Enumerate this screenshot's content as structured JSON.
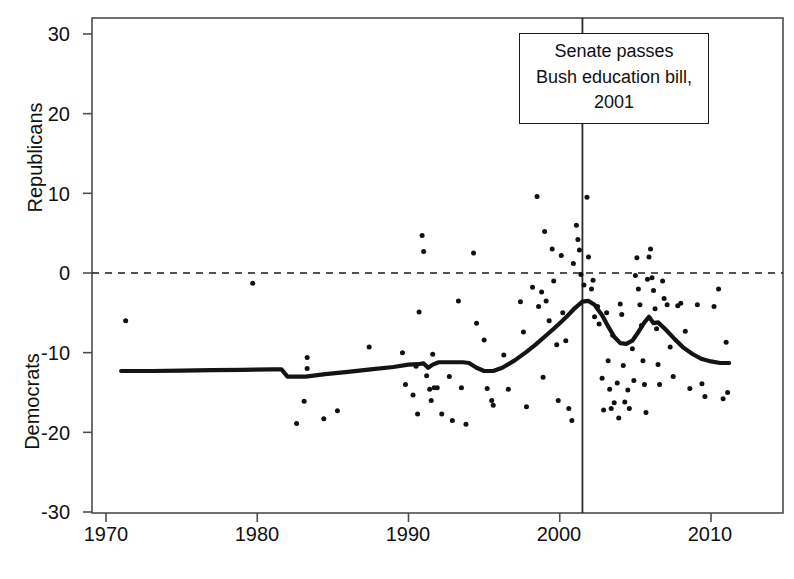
{
  "chart_data": {
    "type": "scatter",
    "title": "",
    "subtitle": "",
    "xlabel": "",
    "ylabel_top": "Republicans",
    "ylabel_bottom": "Democrats",
    "xlim": [
      1970.2,
      1971.2
    ],
    "x_range": [
      1968.5,
      2012.0
    ],
    "ylim": [
      -32.0,
      32.0
    ],
    "grid": false,
    "legend": null,
    "xticks": [
      1970,
      1980,
      1990,
      2000,
      2010
    ],
    "xticklabels": [
      "1970",
      "1980",
      "1990",
      "2000",
      "2010"
    ],
    "yticks": [
      30,
      20,
      10,
      0,
      -10,
      -20,
      -30
    ],
    "yticklabels": [
      "30",
      "20",
      "10",
      "0",
      "-10",
      "-20",
      "-30"
    ],
    "zero_line": {
      "value": 0,
      "style": "dashed",
      "label": ""
    },
    "vline": {
      "x": 2001.5,
      "style": "solid",
      "label": "Senate passes Bush education bill, 2001"
    },
    "annotation": {
      "line1": "Senate passes",
      "line2": "Bush education bill,",
      "line3": "2001"
    },
    "series": [
      {
        "name": "trend",
        "type": "line",
        "points": [
          [
            1971.0,
            -12.3
          ],
          [
            1973.0,
            -12.3
          ],
          [
            1975.0,
            -12.25
          ],
          [
            1977.0,
            -12.2
          ],
          [
            1979.0,
            -12.15
          ],
          [
            1981.0,
            -12.1
          ],
          [
            1981.6,
            -12.1
          ],
          [
            1982.0,
            -13.0
          ],
          [
            1983.2,
            -13.0
          ],
          [
            1984.5,
            -12.7
          ],
          [
            1986.0,
            -12.4
          ],
          [
            1987.5,
            -12.1
          ],
          [
            1989.0,
            -11.8
          ],
          [
            1990.0,
            -11.5
          ],
          [
            1990.6,
            -11.45
          ],
          [
            1991.0,
            -11.35
          ],
          [
            1991.3,
            -11.9
          ],
          [
            1991.6,
            -11.5
          ],
          [
            1992.0,
            -11.2
          ],
          [
            1992.4,
            -11.2
          ],
          [
            1993.0,
            -11.2
          ],
          [
            1993.6,
            -11.2
          ],
          [
            1994.0,
            -11.3
          ],
          [
            1994.5,
            -11.9
          ],
          [
            1995.0,
            -12.3
          ],
          [
            1995.6,
            -12.3
          ],
          [
            1996.2,
            -11.9
          ],
          [
            1997.0,
            -11.0
          ],
          [
            1997.8,
            -9.9
          ],
          [
            1998.4,
            -9.0
          ],
          [
            1999.0,
            -8.0
          ],
          [
            1999.6,
            -7.0
          ],
          [
            2000.0,
            -6.3
          ],
          [
            2000.5,
            -5.4
          ],
          [
            2001.0,
            -4.4
          ],
          [
            2001.5,
            -3.6
          ],
          [
            2001.9,
            -3.5
          ],
          [
            2002.3,
            -4.0
          ],
          [
            2002.8,
            -5.3
          ],
          [
            2003.2,
            -6.7
          ],
          [
            2003.6,
            -8.0
          ],
          [
            2004.0,
            -8.8
          ],
          [
            2004.4,
            -8.9
          ],
          [
            2004.8,
            -8.5
          ],
          [
            2005.2,
            -7.4
          ],
          [
            2005.6,
            -6.2
          ],
          [
            2005.9,
            -5.5
          ],
          [
            2006.2,
            -6.3
          ],
          [
            2006.5,
            -6.2
          ],
          [
            2007.0,
            -7.1
          ],
          [
            2007.6,
            -8.3
          ],
          [
            2008.2,
            -9.4
          ],
          [
            2008.8,
            -10.2
          ],
          [
            2009.4,
            -10.8
          ],
          [
            2010.0,
            -11.1
          ],
          [
            2010.6,
            -11.3
          ],
          [
            2011.2,
            -11.3
          ]
        ]
      },
      {
        "name": "observations",
        "type": "scatter",
        "points": [
          [
            1971.3,
            -6.0
          ],
          [
            1979.7,
            -1.3
          ],
          [
            1982.6,
            -18.9
          ],
          [
            1983.1,
            -16.1
          ],
          [
            1983.3,
            -10.6
          ],
          [
            1983.3,
            -12.0
          ],
          [
            1984.4,
            -18.3
          ],
          [
            1985.3,
            -17.3
          ],
          [
            1987.4,
            -9.3
          ],
          [
            1989.6,
            -10.0
          ],
          [
            1989.8,
            -14.0
          ],
          [
            1990.3,
            -15.3
          ],
          [
            1990.5,
            -11.7
          ],
          [
            1990.6,
            -17.7
          ],
          [
            1990.7,
            -4.9
          ],
          [
            1990.9,
            4.7
          ],
          [
            1991.0,
            2.7
          ],
          [
            1991.2,
            -12.9
          ],
          [
            1991.4,
            -14.6
          ],
          [
            1991.5,
            -16.0
          ],
          [
            1991.6,
            -10.2
          ],
          [
            1991.7,
            -14.4
          ],
          [
            1991.9,
            -14.4
          ],
          [
            1992.2,
            -17.7
          ],
          [
            1992.7,
            -13.0
          ],
          [
            1992.9,
            -18.5
          ],
          [
            1993.3,
            -3.5
          ],
          [
            1993.5,
            -14.4
          ],
          [
            1993.8,
            -19.0
          ],
          [
            1994.3,
            2.5
          ],
          [
            1994.5,
            -6.3
          ],
          [
            1995.0,
            -8.4
          ],
          [
            1995.2,
            -14.5
          ],
          [
            1995.5,
            -16.0
          ],
          [
            1995.6,
            -16.6
          ],
          [
            1996.3,
            -10.3
          ],
          [
            1996.6,
            -14.6
          ],
          [
            1997.4,
            -3.6
          ],
          [
            1997.6,
            -7.4
          ],
          [
            1997.8,
            -16.8
          ],
          [
            1998.2,
            -1.8
          ],
          [
            1998.5,
            9.6
          ],
          [
            1998.6,
            -4.2
          ],
          [
            1998.8,
            -2.4
          ],
          [
            1998.9,
            -13.1
          ],
          [
            1999.0,
            5.2
          ],
          [
            1999.1,
            -3.5
          ],
          [
            1999.3,
            -6.0
          ],
          [
            1999.5,
            3.0
          ],
          [
            1999.6,
            -1.0
          ],
          [
            1999.8,
            -9.0
          ],
          [
            1999.9,
            -16.0
          ],
          [
            2000.1,
            2.2
          ],
          [
            2000.2,
            -5.0
          ],
          [
            2000.4,
            -8.5
          ],
          [
            2000.6,
            -17.0
          ],
          [
            2000.8,
            -18.5
          ],
          [
            2000.9,
            1.2
          ],
          [
            2001.1,
            6.0
          ],
          [
            2001.2,
            4.2
          ],
          [
            2001.3,
            2.9
          ],
          [
            2001.4,
            -0.2
          ],
          [
            2001.6,
            -1.5
          ],
          [
            2001.8,
            9.5
          ],
          [
            2001.9,
            2.0
          ],
          [
            2002.1,
            -2.0
          ],
          [
            2002.2,
            -0.9
          ],
          [
            2002.3,
            -5.5
          ],
          [
            2002.5,
            -4.2
          ],
          [
            2002.6,
            -6.4
          ],
          [
            2002.8,
            -13.2
          ],
          [
            2002.9,
            -17.2
          ],
          [
            2003.1,
            -5.0
          ],
          [
            2003.2,
            -11.0
          ],
          [
            2003.3,
            -14.6
          ],
          [
            2003.4,
            -17.0
          ],
          [
            2003.5,
            -7.8
          ],
          [
            2003.6,
            -16.3
          ],
          [
            2003.8,
            -13.8
          ],
          [
            2003.9,
            -18.2
          ],
          [
            2004.0,
            -3.9
          ],
          [
            2004.1,
            -5.2
          ],
          [
            2004.2,
            -11.6
          ],
          [
            2004.3,
            -16.2
          ],
          [
            2004.5,
            -14.7
          ],
          [
            2004.6,
            -17.0
          ],
          [
            2004.8,
            -9.5
          ],
          [
            2004.9,
            -13.5
          ],
          [
            2005.0,
            -0.3
          ],
          [
            2005.1,
            1.9
          ],
          [
            2005.2,
            -2.0
          ],
          [
            2005.3,
            -4.0
          ],
          [
            2005.4,
            -6.6
          ],
          [
            2005.5,
            -11.0
          ],
          [
            2005.6,
            -14.0
          ],
          [
            2005.7,
            -17.5
          ],
          [
            2005.8,
            -0.8
          ],
          [
            2005.9,
            2.0
          ],
          [
            2006.0,
            3.0
          ],
          [
            2006.1,
            -0.6
          ],
          [
            2006.2,
            -2.2
          ],
          [
            2006.3,
            -4.5
          ],
          [
            2006.4,
            -7.0
          ],
          [
            2006.5,
            -11.5
          ],
          [
            2006.6,
            -14.0
          ],
          [
            2006.8,
            -1.0
          ],
          [
            2006.9,
            -3.2
          ],
          [
            2007.1,
            -4.0
          ],
          [
            2007.3,
            -9.3
          ],
          [
            2007.5,
            -13.0
          ],
          [
            2007.8,
            -4.1
          ],
          [
            2008.0,
            -3.8
          ],
          [
            2008.3,
            -7.3
          ],
          [
            2008.6,
            -14.5
          ],
          [
            2009.1,
            -4.0
          ],
          [
            2009.4,
            -13.9
          ],
          [
            2009.6,
            -15.5
          ],
          [
            2010.2,
            -4.2
          ],
          [
            2010.5,
            -2.0
          ],
          [
            2010.8,
            -15.8
          ],
          [
            2011.0,
            -8.7
          ],
          [
            2011.1,
            -15.0
          ]
        ]
      }
    ]
  },
  "axes": {
    "x_tick_labels": [
      "1970",
      "1980",
      "1990",
      "2000",
      "2010"
    ],
    "y_tick_labels": [
      "30",
      "20",
      "10",
      "0",
      "-10",
      "-20",
      "-30"
    ],
    "y_title_upper": "Republicans",
    "y_title_lower": "Democrats"
  },
  "annotation": {
    "line1": "Senate passes",
    "line2": "Bush education bill,",
    "line3": "2001"
  },
  "colors": {
    "foreground": "#1a1a1a",
    "background": "#ffffff",
    "point": "#111111",
    "trend": "#141414"
  }
}
